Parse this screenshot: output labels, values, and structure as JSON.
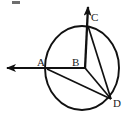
{
  "figure": {
    "background_color": "#ffffff",
    "stroke_color": "#111111",
    "label_color": "#1a1a1a"
  },
  "labels": {
    "A": "A",
    "B": "B",
    "C": "C",
    "D": "D"
  },
  "points": {
    "A": {
      "name": "A",
      "x": 47,
      "y": 68,
      "role": "point-on-circle-left"
    },
    "B": {
      "name": "B",
      "x": 84,
      "y": 68,
      "role": "circle-center"
    },
    "C": {
      "name": "C",
      "x": 88,
      "y": 26,
      "role": "point-on-circle-top"
    },
    "D": {
      "name": "D",
      "x": 111,
      "y": 99,
      "role": "point-on-circle-lower-right"
    }
  },
  "circle": {
    "name": "main-circle",
    "center_x": 82,
    "center_y": 68,
    "radius_x": 37,
    "radius_y": 42
  },
  "rays": [
    {
      "name": "ray-left-through-A",
      "from": "B",
      "through": "A",
      "tip_x": 5,
      "tip_y": 68,
      "direction": "left",
      "arrowhead": true
    },
    {
      "name": "ray-up-through-C",
      "from": "B",
      "through": "C",
      "tip_x": 88,
      "tip_y": 3,
      "direction": "up",
      "arrowhead": true
    }
  ],
  "segments": [
    {
      "name": "segment-B-D",
      "from": "B",
      "to": "D"
    },
    {
      "name": "segment-A-D",
      "from": "A",
      "to": "D"
    },
    {
      "name": "segment-C-D",
      "from": "C",
      "to": "D"
    }
  ],
  "artifacts": [
    {
      "name": "scan-speck-top-left",
      "x": 12,
      "y": 1,
      "width": 8,
      "height": 3
    }
  ]
}
